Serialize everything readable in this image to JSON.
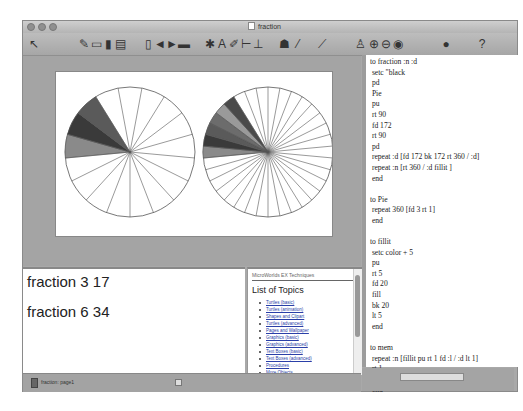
{
  "window": {
    "title": "fraction",
    "icons": {
      "doc": "document-icon"
    }
  },
  "toolbar": {
    "tools": [
      {
        "name": "pointer-tool",
        "glyph": "↖"
      },
      {
        "name": "open-tool",
        "glyph": "✎"
      },
      {
        "name": "folder-tool",
        "glyph": "▭"
      },
      {
        "name": "save-tool",
        "glyph": "▮"
      },
      {
        "name": "print-tool",
        "glyph": "▤"
      },
      {
        "name": "new-page-tool",
        "glyph": "▯"
      },
      {
        "name": "back-tool",
        "glyph": "◄"
      },
      {
        "name": "forward-tool",
        "glyph": "►"
      },
      {
        "name": "page-tool",
        "glyph": "▬"
      },
      {
        "name": "turtle-tool",
        "glyph": "✱"
      },
      {
        "name": "text-tool",
        "glyph": "A"
      },
      {
        "name": "paint-tool",
        "glyph": "✐"
      },
      {
        "name": "slider-tool",
        "glyph": "⊢"
      },
      {
        "name": "button-tool",
        "glyph": "⊥"
      },
      {
        "name": "hatch-tool",
        "glyph": "☗"
      },
      {
        "name": "eraser-tool",
        "glyph": "⁄"
      },
      {
        "name": "magic-wand-tool",
        "glyph": "⟋"
      },
      {
        "name": "stamp-tool",
        "glyph": "♙"
      },
      {
        "name": "grow-tool",
        "glyph": "⊕"
      },
      {
        "name": "shrink-tool",
        "glyph": "⊖"
      },
      {
        "name": "eye-tool",
        "glyph": "◉"
      },
      {
        "name": "stop-tool",
        "glyph": "●"
      },
      {
        "name": "help-tool",
        "glyph": "?"
      }
    ]
  },
  "drawing": {
    "pies": [
      {
        "label": "fraction 3 17",
        "slices": 17,
        "filled": 3
      },
      {
        "label": "fraction 6 34",
        "slices": 34,
        "filled": 6
      }
    ]
  },
  "command_center": {
    "lines": [
      "fraction 3 17",
      "fraction 6 34"
    ]
  },
  "help": {
    "header": "MicroWorlds EX Techniques",
    "title": "List of Topics",
    "topics": [
      "Turtles (basic)",
      "Turtles (animation)",
      "Shapes and Clipart",
      "Turtles (advanced)",
      "Pages and Wallpaper",
      "Graphics (basic)",
      "Graphics (advanced)",
      "Text Boxes (basic)",
      "Text Boxes (advanced)",
      "Procedures",
      "More Objects"
    ]
  },
  "procedures": {
    "text": "to fraction :n :d\n setc \"black\n pd\n Pie\n pu\n rt 90\n fd 172\n rt 90\n pd\n repeat :d [fd 172 bk 172 rt 360 / :d]\n repeat :n [rt 360 / :d fillit ]\n end\n\nto Pie\n repeat 360 [fd 3 rt 1]\n end\n\nto fillit\n setc color + 5\n pu\n rt 5\n fd 20\n fill\n bk 20\n lt 5\n end\n\nto mem\n repeat :n [fillit pu rt 1 fd :l / :d lt 1]\n rt 1\n bk :n / :d * :l lt 1\n end"
  },
  "statusbar": {
    "text": "fraction:  page1"
  }
}
